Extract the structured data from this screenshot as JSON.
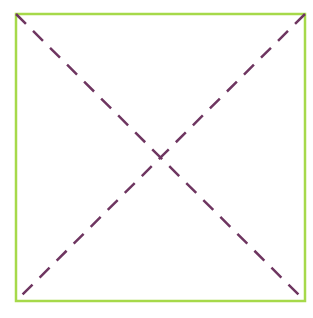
{
  "diagram": {
    "type": "square-with-diagonals",
    "square": {
      "x": 16,
      "y": 14,
      "width": 289,
      "height": 287,
      "stroke": "#a6d94a",
      "stroke_width": 2.5
    },
    "diagonals": {
      "stroke": "#6e3560",
      "stroke_width": 2.5,
      "dash": "14 10",
      "lines": [
        {
          "x1": 16,
          "y1": 14,
          "x2": 305,
          "y2": 301
        },
        {
          "x1": 305,
          "y1": 14,
          "x2": 16,
          "y2": 301
        }
      ]
    },
    "labels": []
  }
}
